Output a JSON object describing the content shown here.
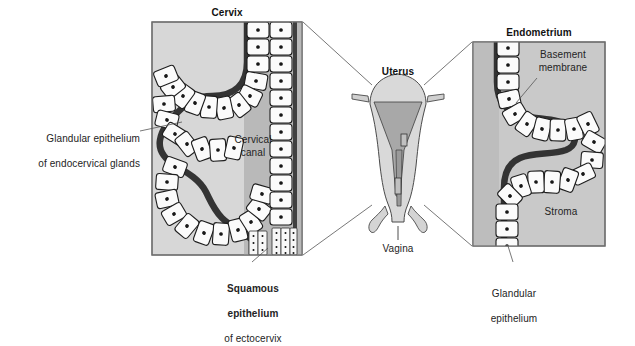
{
  "figure": {
    "kind": "anatomical-histology-diagram",
    "background_color": "#ffffff"
  },
  "colors": {
    "panel_fill": "#d4d4d4",
    "panel_fill_light": "#dcdcdc",
    "canal_fill": "#b3b3b3",
    "stroma_fill": "#c9c9c9",
    "cell_fill": "#fbfbfb",
    "outline": "#1a1a1a",
    "border": "#6e6e6e",
    "leader_line": "#555555",
    "text": "#242424",
    "uterus_fill": "#d9d9d9",
    "uterus_cavity": "#a8a8a8"
  },
  "left_panel": {
    "title": "Cervix",
    "region_labels": {
      "canal": "Cervical\ncanal"
    },
    "box": {
      "x": 151,
      "y": 21,
      "w": 152,
      "h": 235
    }
  },
  "center_panel": {
    "title": "Uterus",
    "vagina_label": "Vagina"
  },
  "right_panel": {
    "title": "Endometrium",
    "region_labels": {
      "stroma": "Stroma",
      "basement_membrane": "Basement\nmembrane"
    },
    "box": {
      "x": 472,
      "y": 41,
      "w": 134,
      "h": 206
    }
  },
  "callouts": [
    {
      "name": "glandular-epithelium-endocervical",
      "line1": "Glandular epithelium",
      "line2": "of endocervical glands",
      "bold_lines": [],
      "align": "right"
    },
    {
      "name": "squamous-epithelium-ectocervix",
      "line1": "Squamous",
      "line2": "epithelium",
      "line3": "of ectocervix",
      "bold_lines": [
        "line1",
        "line2"
      ],
      "align": "center"
    },
    {
      "name": "glandular-epithelium-endometrium",
      "line1": "Glandular",
      "line2": "epithelium",
      "bold_lines": [],
      "align": "center"
    }
  ]
}
